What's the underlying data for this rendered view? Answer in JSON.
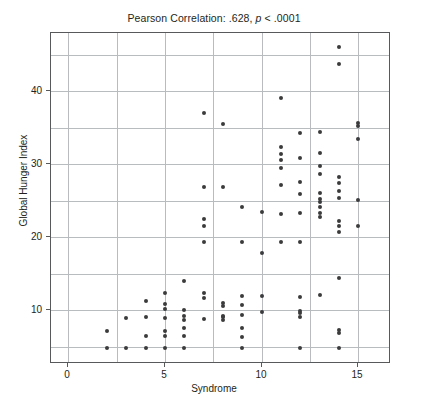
{
  "chart_data": {
    "type": "scatter",
    "title": "Pearson Correlation: .628, p < .0001",
    "title_prefix": "Pearson Correlation: .628, ",
    "title_italic": "p",
    "title_suffix": " < .0001",
    "xlabel": "Syndrome",
    "ylabel": "Global Hunger Index",
    "xlim": [
      -0.9,
      16.7
    ],
    "ylim": [
      2.6,
      48.0
    ],
    "xticks": [
      0,
      5,
      10,
      15
    ],
    "yticks": [
      10,
      20,
      30,
      40
    ],
    "xgrid_values": [
      0,
      2.5,
      5,
      7.5,
      10,
      12.5,
      15
    ],
    "ygrid_values": [
      5,
      10,
      15,
      20,
      25,
      30,
      35,
      40,
      45
    ],
    "grid": true,
    "legend": "none",
    "marker": "filled-circle",
    "marker_color": "#3b3b3d",
    "statistics": {
      "pearson_r": ".628",
      "p_value": "< .0001"
    },
    "points": [
      [
        2,
        4.8
      ],
      [
        2,
        7.1
      ],
      [
        3,
        4.8
      ],
      [
        3,
        8.9
      ],
      [
        4,
        4.8
      ],
      [
        4,
        6.4
      ],
      [
        4,
        9.0
      ],
      [
        4,
        11.2
      ],
      [
        5,
        4.8
      ],
      [
        5,
        6.4
      ],
      [
        5,
        7.2
      ],
      [
        5,
        8.9
      ],
      [
        5,
        10.1
      ],
      [
        5,
        10.8
      ],
      [
        5,
        12.3
      ],
      [
        6,
        4.8
      ],
      [
        6,
        6.5
      ],
      [
        6,
        7.5
      ],
      [
        6,
        8.6
      ],
      [
        6,
        9.2
      ],
      [
        6,
        10.0
      ],
      [
        6,
        14.0
      ],
      [
        7,
        8.8
      ],
      [
        7,
        11.7
      ],
      [
        7,
        12.3
      ],
      [
        7,
        19.3
      ],
      [
        7,
        21.5
      ],
      [
        7,
        22.5
      ],
      [
        7,
        26.9
      ],
      [
        7,
        37.0
      ],
      [
        8,
        8.6
      ],
      [
        8,
        9.0
      ],
      [
        8,
        9.2
      ],
      [
        8,
        10.6
      ],
      [
        8,
        11.0
      ],
      [
        8,
        26.9
      ],
      [
        8,
        35.5
      ],
      [
        9,
        4.8
      ],
      [
        9,
        6.3
      ],
      [
        9,
        7.6
      ],
      [
        9,
        9.3
      ],
      [
        9,
        10.7
      ],
      [
        9,
        11.9
      ],
      [
        9,
        19.4
      ],
      [
        9,
        24.2
      ],
      [
        10,
        9.7
      ],
      [
        10,
        11.9
      ],
      [
        10,
        17.9
      ],
      [
        10,
        23.4
      ],
      [
        11,
        19.3
      ],
      [
        11,
        23.2
      ],
      [
        11,
        27.1
      ],
      [
        11,
        29.5
      ],
      [
        11,
        30.6
      ],
      [
        11,
        31.4
      ],
      [
        11,
        32.4
      ],
      [
        11,
        39.1
      ],
      [
        12,
        4.8
      ],
      [
        12,
        9.1
      ],
      [
        12,
        9.6
      ],
      [
        12,
        9.9
      ],
      [
        12,
        11.8
      ],
      [
        12,
        19.4
      ],
      [
        12,
        23.3
      ],
      [
        12,
        25.9
      ],
      [
        12,
        27.6
      ],
      [
        12,
        30.9
      ],
      [
        12,
        34.3
      ],
      [
        13,
        12.1
      ],
      [
        13,
        22.8
      ],
      [
        13,
        23.3
      ],
      [
        13,
        24.1
      ],
      [
        13,
        24.8
      ],
      [
        13,
        25.3
      ],
      [
        13,
        26.0
      ],
      [
        13,
        28.6
      ],
      [
        13,
        29.7
      ],
      [
        13,
        31.5
      ],
      [
        13,
        34.4
      ],
      [
        14,
        4.8
      ],
      [
        14,
        6.8
      ],
      [
        14,
        7.3
      ],
      [
        14,
        14.4
      ],
      [
        14,
        20.7
      ],
      [
        14,
        21.5
      ],
      [
        14,
        22.2
      ],
      [
        14,
        25.4
      ],
      [
        14,
        26.3
      ],
      [
        14,
        27.5
      ],
      [
        14,
        28.2
      ],
      [
        14,
        43.8
      ],
      [
        14,
        46.1
      ],
      [
        15,
        21.5
      ],
      [
        15,
        25.1
      ],
      [
        15,
        33.4
      ],
      [
        15,
        35.2
      ],
      [
        15,
        35.7
      ]
    ]
  }
}
